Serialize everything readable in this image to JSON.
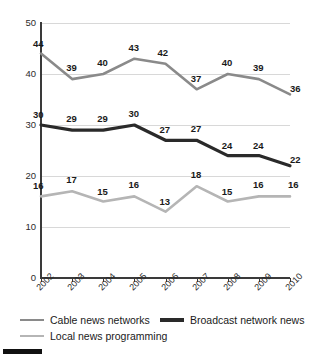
{
  "chart_data": {
    "type": "line",
    "title": "",
    "xlabel": "",
    "ylabel": "",
    "categories": [
      "2002",
      "2003",
      "2004",
      "2005",
      "2006",
      "2007",
      "2008",
      "2009",
      "2010"
    ],
    "ylim": [
      0,
      50
    ],
    "yticks": [
      0,
      10,
      20,
      30,
      40,
      50
    ],
    "grid": true,
    "legend_position": "bottom",
    "series": [
      {
        "name": "Cable news networks",
        "color": "#8a8a8a",
        "values": [
          44,
          39,
          40,
          43,
          42,
          37,
          40,
          39,
          36
        ]
      },
      {
        "name": "Broadcast network news",
        "color": "#2a2a2a",
        "values": [
          30,
          29,
          29,
          30,
          27,
          27,
          24,
          24,
          22
        ]
      },
      {
        "name": "Local news programming",
        "color": "#b5b5b5",
        "values": [
          16,
          17,
          15,
          16,
          13,
          18,
          15,
          16,
          16
        ]
      }
    ]
  },
  "axis": {
    "y_tick_labels": [
      "50",
      "40",
      "30",
      "20",
      "10",
      "0"
    ]
  }
}
